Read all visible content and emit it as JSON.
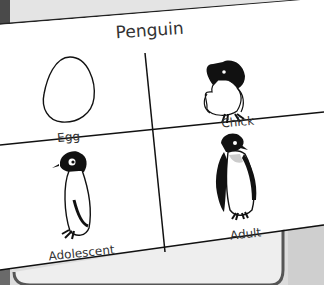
{
  "card": {
    "title": "Penguin",
    "stages": [
      {
        "label": "Egg",
        "icon": "egg-icon"
      },
      {
        "label": "Chick",
        "icon": "penguin-chick-icon"
      },
      {
        "label": "Adolescent",
        "icon": "penguin-adolescent-icon"
      },
      {
        "label": "Adult",
        "icon": "penguin-adult-icon"
      }
    ]
  },
  "colors": {
    "ink": "#111111",
    "paper": "#ffffff",
    "background": "#e6e6e6",
    "tray_edge": "#555555"
  }
}
